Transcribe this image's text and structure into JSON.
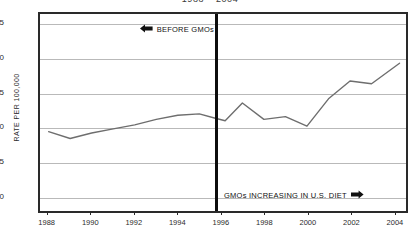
{
  "chart_data": {
    "type": "line",
    "title": "1988 – 2004",
    "xlabel": "",
    "ylabel": "RATE PER 100,000",
    "xlim": [
      1987.6,
      2004.6
    ],
    "ylim": [
      38,
      182
    ],
    "grid": true,
    "legend": "none",
    "y_ticks": [
      50,
      75,
      100,
      125,
      150,
      175
    ],
    "y_tick_labels": [
      "50",
      "75",
      "100",
      "125",
      "150",
      "175"
    ],
    "x_ticks": [
      1988,
      1990,
      1992,
      1994,
      1996,
      1998,
      2000,
      2002,
      2004
    ],
    "x_tick_labels": [
      "1988",
      "1990",
      "1992",
      "1994",
      "1996",
      "1998",
      "2000",
      "2002",
      "2004"
    ],
    "x": [
      1988,
      1989,
      1990,
      1991,
      1992,
      1993,
      1994,
      1995,
      1996,
      1997,
      1998,
      1999,
      2000,
      2001,
      2002,
      2003,
      2004
    ],
    "values": [
      96,
      91,
      94,
      97,
      100,
      102,
      106,
      109,
      108,
      104,
      117,
      105,
      107,
      100,
      120,
      133,
      131
    ],
    "series": [
      {
        "name": "rate per 100,000",
        "color": "#6e6e6e",
        "points": [
          {
            "x": 1988.0,
            "y": 96
          },
          {
            "x": 1989.0,
            "y": 91
          },
          {
            "x": 1990.0,
            "y": 95
          },
          {
            "x": 1991.0,
            "y": 98
          },
          {
            "x": 1992.0,
            "y": 101
          },
          {
            "x": 1993.0,
            "y": 105
          },
          {
            "x": 1994.0,
            "y": 108
          },
          {
            "x": 1995.0,
            "y": 109
          },
          {
            "x": 1995.7,
            "y": 106
          },
          {
            "x": 1996.2,
            "y": 104
          },
          {
            "x": 1997.0,
            "y": 117
          },
          {
            "x": 1998.0,
            "y": 105
          },
          {
            "x": 1999.0,
            "y": 107
          },
          {
            "x": 2000.0,
            "y": 100
          },
          {
            "x": 2001.0,
            "y": 120
          },
          {
            "x": 2002.0,
            "y": 133
          },
          {
            "x": 2003.0,
            "y": 131
          },
          {
            "x": 2004.3,
            "y": 146
          }
        ]
      }
    ],
    "annotations": [
      {
        "id": "before-gmos",
        "text": "BEFORE GMOs",
        "arrow": "left-arrow-icon",
        "arrow_direction": "left",
        "position": "upper-left-of-divider"
      },
      {
        "id": "gmos-increasing",
        "text": "GMOs INCREASING IN U.S. DIET",
        "arrow": "right-arrow-icon",
        "arrow_direction": "right",
        "position": "lower-right-of-divider"
      }
    ],
    "reference_line": {
      "id": "gmo-introduction-divider",
      "x": 1995.7,
      "orientation": "vertical",
      "color": "#0d0d0d"
    },
    "colors": {
      "line": "#6e6e6e",
      "grid": "#b9b9b9",
      "frame": "#2a2a2a",
      "divider": "#0d0d0d",
      "text": "#2b2b2b",
      "background": "#ffffff"
    }
  }
}
